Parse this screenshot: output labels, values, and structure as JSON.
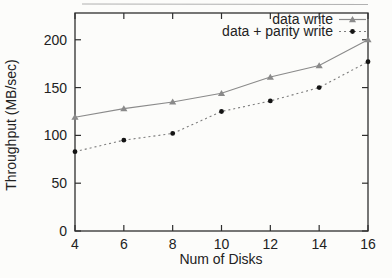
{
  "figure": {
    "background": "#fcfcfa",
    "frame_color": "#2e2e2e",
    "text_color": "#222222"
  },
  "chart_data": {
    "type": "line",
    "title": "",
    "xlabel": "Num of Disks",
    "ylabel": "Throughput (MB/sec)",
    "x": [
      4,
      6,
      8,
      10,
      12,
      14,
      16
    ],
    "xticks": [
      4,
      6,
      8,
      10,
      12,
      14,
      16
    ],
    "yticks": [
      0,
      50,
      100,
      150,
      200
    ],
    "xlim": [
      4,
      16
    ],
    "ylim": [
      0,
      228
    ],
    "grid": false,
    "legend_position": "top-right-inside",
    "series": [
      {
        "name": "data write",
        "line_style": "solid",
        "marker": "triangle",
        "color": "#8a8a8a",
        "marker_color": "#8a8a8a",
        "values": [
          119,
          128,
          135,
          144,
          161,
          173,
          200
        ]
      },
      {
        "name": "data + parity write",
        "line_style": "dashed",
        "marker": "circle",
        "color": "#7d7d7d",
        "marker_color": "#141414",
        "values": [
          83,
          95,
          102,
          125,
          136,
          150,
          177
        ]
      }
    ]
  }
}
